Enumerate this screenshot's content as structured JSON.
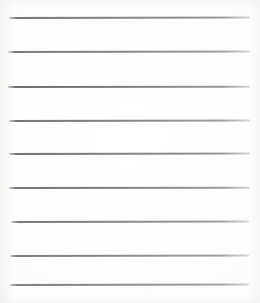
{
  "image": {
    "kind": "scanned-lined-paper",
    "title": "Blank ruled notebook paper",
    "width_px": 260,
    "height_px": 303,
    "background_color": "#fdfdfd",
    "line_color": "#6a6a6e",
    "text_content": "",
    "notes": "No text, numbers, labels or icons are present in the image."
  },
  "ruled_lines": {
    "count": 9,
    "line_thickness_px": 1.6,
    "left_x_px": 8,
    "right_x_px": 250,
    "nominal_spacing_px": 34,
    "items": [
      {
        "index": 1,
        "y_px": 17,
        "left_px": 9,
        "width_px": 241,
        "tilt_deg": -0.12,
        "opacity": 0.9
      },
      {
        "index": 2,
        "y_px": 51,
        "left_px": 8,
        "width_px": 242,
        "tilt_deg": -0.1,
        "opacity": 0.88
      },
      {
        "index": 3,
        "y_px": 86,
        "left_px": 8,
        "width_px": 242,
        "tilt_deg": -0.08,
        "opacity": 0.95
      },
      {
        "index": 4,
        "y_px": 120,
        "left_px": 9,
        "width_px": 241,
        "tilt_deg": -0.1,
        "opacity": 0.9
      },
      {
        "index": 5,
        "y_px": 153,
        "left_px": 9,
        "width_px": 241,
        "tilt_deg": -0.1,
        "opacity": 0.92
      },
      {
        "index": 6,
        "y_px": 187,
        "left_px": 9,
        "width_px": 241,
        "tilt_deg": -0.08,
        "opacity": 0.92
      },
      {
        "index": 7,
        "y_px": 221,
        "left_px": 11,
        "width_px": 238,
        "tilt_deg": -0.1,
        "opacity": 0.88
      },
      {
        "index": 8,
        "y_px": 255,
        "left_px": 10,
        "width_px": 239,
        "tilt_deg": -0.12,
        "opacity": 0.86
      },
      {
        "index": 9,
        "y_px": 284,
        "left_px": 10,
        "width_px": 239,
        "tilt_deg": -0.1,
        "opacity": 0.84
      }
    ]
  }
}
